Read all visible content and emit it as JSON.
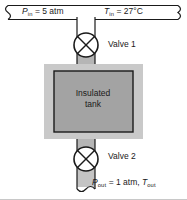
{
  "figure": {
    "inlet": {
      "pressure_symbol": "P",
      "pressure_subscript": "in",
      "pressure_value": "= 5 atm",
      "temperature_symbol": "T",
      "temperature_subscript": "in",
      "temperature_value": "= 27°C"
    },
    "outlet": {
      "pressure_symbol": "P",
      "pressure_subscript": "out",
      "pressure_value": "= 1 atm,",
      "temperature_symbol": "T",
      "temperature_subscript": "out"
    },
    "valves": [
      {
        "label": "Valve 1",
        "icon": "gate-valve-icon"
      },
      {
        "label": "Valve 2",
        "icon": "gate-valve-icon"
      }
    ],
    "tank": {
      "label_line1": "Insulated",
      "label_line2": "tank"
    },
    "colors": {
      "insulation_fill": "#c9c9c9",
      "tank_fill": "#a3a3a3",
      "pipe_fill": "#b5b5b5",
      "outline": "#1a1a1a",
      "background": "#ffffff",
      "frame_line": "#c8c8c8"
    }
  }
}
